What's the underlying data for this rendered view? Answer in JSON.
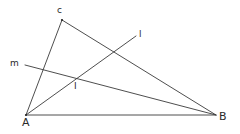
{
  "figure": {
    "width": 240,
    "height": 134,
    "stroke_color": "#3a3a3a",
    "label_color": "#2a2a2a",
    "points": {
      "A": {
        "label": "A",
        "x": 26,
        "y": 115
      },
      "B": {
        "label": "B",
        "x": 216,
        "y": 115
      },
      "C": {
        "label": "c",
        "x": 62,
        "y": 20
      },
      "I": {
        "label": "I",
        "x": 75,
        "y": 79
      }
    },
    "segments": [
      {
        "name": "side-AB",
        "from": "A",
        "to": "B"
      },
      {
        "name": "side-AC",
        "from": "A",
        "to": "C"
      },
      {
        "name": "side-BC",
        "from": "B",
        "to": "C"
      }
    ],
    "lines": {
      "l": {
        "label": "l",
        "x1": 26,
        "y1": 115,
        "x2": 136,
        "y2": 36
      },
      "m": {
        "label": "m",
        "x1": 25,
        "y1": 65,
        "x2": 216,
        "y2": 115
      }
    },
    "labels": {
      "A": {
        "text": "A",
        "x": 22,
        "y": 126
      },
      "B": {
        "text": "B",
        "x": 219,
        "y": 120
      },
      "C": {
        "text": "c",
        "x": 57,
        "y": 13
      },
      "I": {
        "text": "I",
        "x": 74,
        "y": 89
      },
      "l": {
        "text": "l",
        "x": 139,
        "y": 37
      },
      "m": {
        "text": "m",
        "x": 10,
        "y": 66
      }
    }
  }
}
